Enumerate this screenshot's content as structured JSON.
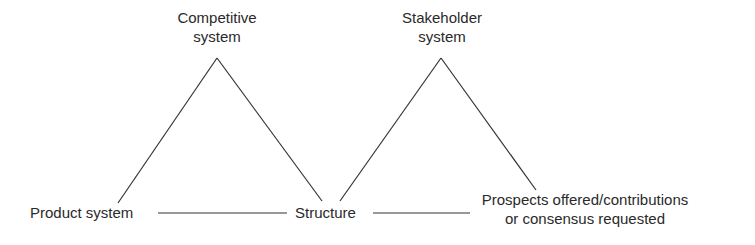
{
  "nodes": {
    "competitive": {
      "line1": "Competitive",
      "line2": "system"
    },
    "stakeholder": {
      "line1": "Stakeholder",
      "line2": "system"
    },
    "product": {
      "label": "Product system"
    },
    "structure": {
      "label": "Structure"
    },
    "prospects": {
      "line1": "Prospects offered/contributions",
      "line2": "or consensus requested"
    }
  },
  "colors": {
    "line": "#333333",
    "text": "#2a2a2a"
  }
}
